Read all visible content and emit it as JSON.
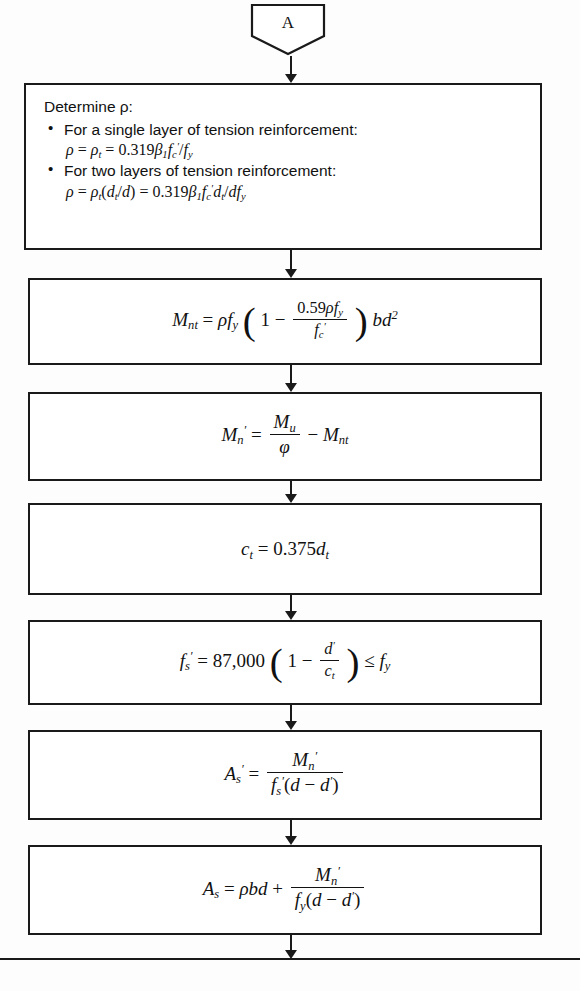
{
  "diagram": {
    "connector": {
      "label": "A",
      "shape": "shield-pentagon"
    },
    "line_color": "#1a1a1a",
    "background": "#fdfdfd",
    "steps": [
      {
        "id": "determine-rho",
        "kind": "process-text",
        "lead": "Determine ρ:",
        "bullets": [
          {
            "text": "For a single layer of tension reinforcement:",
            "equation": "ρ = ρt = 0.319β1f'c/fy"
          },
          {
            "text": "For two layers of tension reinforcement:",
            "equation": "ρ = ρt(dt/d) = 0.319β1f'c dt/dfy"
          }
        ]
      },
      {
        "id": "mnt",
        "kind": "process-formula",
        "equation": "Mnt = ρfy(1 − 0.59ρfy/f'c)bd²"
      },
      {
        "id": "mn-prime",
        "kind": "process-formula",
        "equation": "M'n = Mu/φ − Mnt"
      },
      {
        "id": "ct",
        "kind": "process-formula",
        "equation": "ct = 0.375dt"
      },
      {
        "id": "fs-prime",
        "kind": "process-formula",
        "equation": "f's = 87,000(1 − d'/ct) ≤ fy"
      },
      {
        "id": "as-prime",
        "kind": "process-formula",
        "equation": "A's = M'n / [f's(d − d')]"
      },
      {
        "id": "as",
        "kind": "process-formula",
        "equation": "As = ρbd + M'n/[fy(d − d')]"
      }
    ],
    "numbers": {
      "coef_rho": "0.319",
      "coef_whitney": "0.59",
      "ct_factor": "0.375",
      "es_modulus": "87,000",
      "bd_exponent": "2"
    }
  }
}
